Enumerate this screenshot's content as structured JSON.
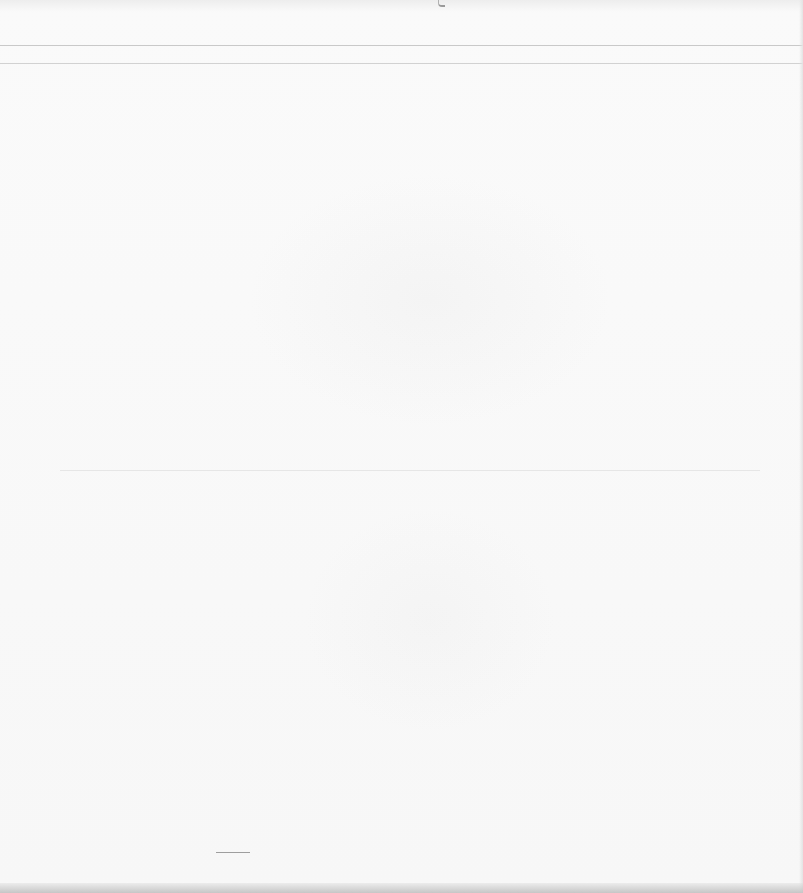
{
  "document": {
    "type": "blank-scanned-page",
    "text_content": "",
    "rules": [
      "top-rule-1",
      "top-rule-2",
      "mid-rule"
    ],
    "colors": {
      "paper": "#f8f8f8",
      "rule": "#c9c9c9",
      "edge_shadow": "#c6c6c6"
    }
  }
}
